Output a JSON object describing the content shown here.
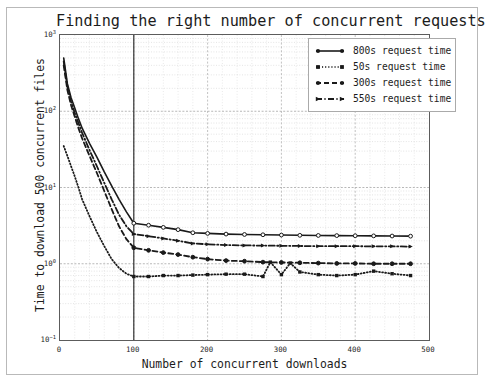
{
  "chart_data": {
    "type": "line",
    "title": "Finding the right number of concurrent requests",
    "xlabel": "Number of concurrent downloads",
    "ylabel": "Time to download 500 concurrent files",
    "xlim": [
      0,
      500
    ],
    "ylim": [
      0.1,
      1000
    ],
    "yscale": "log",
    "xscale": "linear",
    "grid": true,
    "grid_minor": true,
    "legend_position": "upper right",
    "xticks": [
      "0",
      "100",
      "200",
      "300",
      "400",
      "500"
    ],
    "xtick_values": [
      0,
      100,
      200,
      300,
      400,
      500
    ],
    "yticks": [
      "10⁻¹",
      "10⁰",
      "10¹",
      "10²",
      "10³"
    ],
    "ytick_values": [
      0.1,
      1,
      10,
      100,
      1000
    ],
    "annotations": [
      {
        "name": "vertical-reference-line",
        "type": "vline",
        "x": 100,
        "label": ""
      }
    ],
    "series": [
      {
        "name": "800s request time",
        "style": "solid",
        "marker": "circle",
        "color": "#1a1a1a",
        "x": [
          5,
          10,
          15,
          20,
          25,
          30,
          40,
          50,
          60,
          70,
          80,
          90,
          100,
          120,
          140,
          160,
          180,
          200,
          225,
          250,
          275,
          300,
          325,
          350,
          375,
          400,
          425,
          450,
          475
        ],
        "y": [
          500,
          230,
          150,
          110,
          80,
          60,
          38,
          25,
          16,
          10.5,
          7.0,
          4.8,
          3.4,
          3.2,
          3.0,
          2.8,
          2.55,
          2.5,
          2.45,
          2.42,
          2.4,
          2.38,
          2.36,
          2.35,
          2.34,
          2.33,
          2.32,
          2.31,
          2.3
        ]
      },
      {
        "name": "50s request time",
        "style": "dotted",
        "marker": "square",
        "color": "#1a1a1a",
        "x": [
          5,
          10,
          15,
          20,
          25,
          30,
          40,
          50,
          60,
          70,
          80,
          90,
          100,
          120,
          140,
          160,
          180,
          200,
          225,
          250,
          275,
          285,
          300,
          312,
          325,
          350,
          375,
          400,
          425,
          450,
          475
        ],
        "y": [
          35,
          26,
          19,
          14,
          10.0,
          7.0,
          4.2,
          2.6,
          1.7,
          1.15,
          0.88,
          0.74,
          0.68,
          0.68,
          0.7,
          0.7,
          0.71,
          0.72,
          0.73,
          0.73,
          0.68,
          1.05,
          0.72,
          1.02,
          0.78,
          0.72,
          0.7,
          0.72,
          0.8,
          0.74,
          0.7
        ]
      },
      {
        "name": "300s request time",
        "style": "dashed",
        "marker": "circle",
        "color": "#1a1a1a",
        "x": [
          5,
          10,
          15,
          20,
          25,
          30,
          40,
          50,
          60,
          70,
          80,
          90,
          100,
          120,
          140,
          160,
          180,
          200,
          225,
          250,
          275,
          300,
          325,
          350,
          375,
          400,
          425,
          450,
          475
        ],
        "y": [
          400,
          190,
          120,
          85,
          60,
          44,
          26,
          15.5,
          9.0,
          5.2,
          3.1,
          2.1,
          1.62,
          1.5,
          1.4,
          1.32,
          1.22,
          1.15,
          1.1,
          1.08,
          1.05,
          1.04,
          1.03,
          1.02,
          1.01,
          1.01,
          1.0,
          1.0,
          1.0
        ]
      },
      {
        "name": "550s request time",
        "style": "dashdot",
        "marker": "triangle",
        "color": "#1a1a1a",
        "x": [
          5,
          10,
          15,
          20,
          25,
          30,
          40,
          50,
          60,
          70,
          80,
          90,
          100,
          120,
          140,
          160,
          180,
          200,
          225,
          250,
          275,
          300,
          325,
          350,
          375,
          400,
          425,
          450,
          475
        ],
        "y": [
          450,
          210,
          135,
          95,
          70,
          52,
          31,
          19,
          11.5,
          7.0,
          4.4,
          3.1,
          2.45,
          2.3,
          2.15,
          2.0,
          1.85,
          1.8,
          1.76,
          1.74,
          1.73,
          1.72,
          1.71,
          1.7,
          1.7,
          1.7,
          1.69,
          1.69,
          1.68
        ]
      }
    ]
  },
  "legend": {
    "items": [
      {
        "label": "800s request time"
      },
      {
        "label": "50s request time"
      },
      {
        "label": "300s request time"
      },
      {
        "label": "550s request time"
      }
    ]
  }
}
